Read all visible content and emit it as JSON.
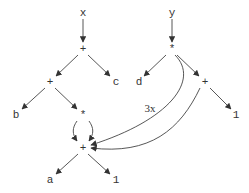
{
  "diagram": {
    "type": "expression-dag",
    "colors": {
      "stroke": "#444444",
      "text": "#333333",
      "background": "#ffffff"
    },
    "nodes": [
      {
        "id": "x",
        "label": "x",
        "x": 83,
        "y": 13
      },
      {
        "id": "plus1",
        "label": "+",
        "x": 83,
        "y": 49
      },
      {
        "id": "y",
        "label": "y",
        "x": 172,
        "y": 13
      },
      {
        "id": "times1",
        "label": "*",
        "x": 172,
        "y": 49
      },
      {
        "id": "plus2",
        "label": "+",
        "x": 50,
        "y": 82
      },
      {
        "id": "c",
        "label": "c",
        "x": 116,
        "y": 82
      },
      {
        "id": "d",
        "label": "d",
        "x": 139,
        "y": 82
      },
      {
        "id": "plus3",
        "label": "+",
        "x": 205,
        "y": 82
      },
      {
        "id": "b",
        "label": "b",
        "x": 16,
        "y": 115
      },
      {
        "id": "times2",
        "label": "*",
        "x": 83,
        "y": 115
      },
      {
        "id": "one_r",
        "label": "1",
        "x": 236,
        "y": 115
      },
      {
        "id": "plus4",
        "label": "+",
        "x": 83,
        "y": 148
      },
      {
        "id": "a",
        "label": "a",
        "x": 50,
        "y": 180
      },
      {
        "id": "one_b",
        "label": "1",
        "x": 116,
        "y": 180
      }
    ],
    "edges": [
      {
        "from": "x",
        "to": "plus1",
        "path": "M83,19 L83,42"
      },
      {
        "from": "plus1",
        "to": "plus2",
        "path": "M78,55 L56,76"
      },
      {
        "from": "plus1",
        "to": "c",
        "path": "M88,55 L110,76"
      },
      {
        "from": "y",
        "to": "times1",
        "path": "M172,19 L172,42"
      },
      {
        "from": "times1",
        "to": "d",
        "path": "M166,55 L144,76"
      },
      {
        "from": "times1",
        "to": "plus3",
        "path": "M177,55 L199,76"
      },
      {
        "from": "plus2",
        "to": "b",
        "path": "M45,88 L22,109"
      },
      {
        "from": "plus2",
        "to": "times2",
        "path": "M55,88 L77,109"
      },
      {
        "from": "plus3",
        "to": "one_r",
        "path": "M210,88 L231,109"
      },
      {
        "from": "times2",
        "to": "plus4",
        "path": "M77,121 C72,128 72,134 77,141"
      },
      {
        "from": "times2",
        "to": "plus4",
        "path": "M89,121 C94,128 94,134 89,141"
      },
      {
        "from": "times1",
        "to": "plus4",
        "label": "3x",
        "path": "M175,55 C200,80 170,120 91,145"
      },
      {
        "from": "plus3",
        "to": "plus4",
        "path": "M200,88 C180,130 150,155 91,148"
      },
      {
        "from": "plus4",
        "to": "a",
        "path": "M78,154 L56,174"
      },
      {
        "from": "plus4",
        "to": "one_b",
        "path": "M88,154 L110,174"
      }
    ],
    "edge_labels": [
      {
        "text": "3x",
        "x": 150,
        "y": 108
      }
    ]
  }
}
